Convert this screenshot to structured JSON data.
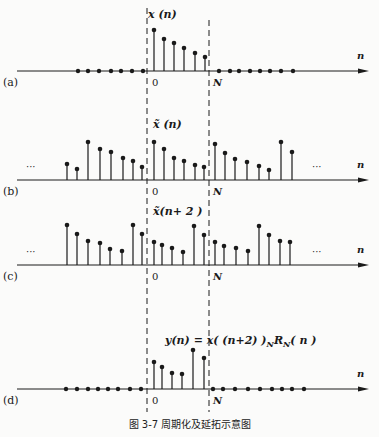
{
  "caption": "图 3-7   周期化及延拓示意图",
  "dashed_lines": {
    "zero_label": "0",
    "N_label": "N"
  },
  "axis_label": "n",
  "ellipsis": "···",
  "panels": [
    {
      "id": "a",
      "tag": "(a)",
      "title": "x (n)",
      "axis_y": 71,
      "dots_before": [
        78,
        88,
        99,
        111,
        121,
        132,
        143
      ],
      "stems": [
        {
          "x": 154,
          "h": 41
        },
        {
          "x": 164,
          "h": 32
        },
        {
          "x": 174,
          "h": 28
        },
        {
          "x": 184,
          "h": 23
        },
        {
          "x": 195,
          "h": 18
        },
        {
          "x": 205,
          "h": 14
        }
      ],
      "dots_after": [
        219,
        230,
        239,
        250,
        260,
        270,
        281,
        293
      ]
    },
    {
      "id": "b",
      "tag": "(b)",
      "title": "x̃ (n)",
      "axis_y": 180,
      "stems": [
        {
          "x": 67,
          "h": 16
        },
        {
          "x": 77,
          "h": 11
        },
        {
          "x": 88,
          "h": 38
        },
        {
          "x": 100,
          "h": 31
        },
        {
          "x": 111,
          "h": 28
        },
        {
          "x": 123,
          "h": 22
        },
        {
          "x": 133,
          "h": 19
        },
        {
          "x": 142,
          "h": 13
        },
        {
          "x": 154,
          "h": 38
        },
        {
          "x": 164,
          "h": 31
        },
        {
          "x": 174,
          "h": 22
        },
        {
          "x": 184,
          "h": 19
        },
        {
          "x": 195,
          "h": 15
        },
        {
          "x": 204,
          "h": 13
        },
        {
          "x": 215,
          "h": 36
        },
        {
          "x": 225,
          "h": 27
        },
        {
          "x": 235,
          "h": 21
        },
        {
          "x": 247,
          "h": 18
        },
        {
          "x": 259,
          "h": 14
        },
        {
          "x": 269,
          "h": 10
        },
        {
          "x": 281,
          "h": 38
        },
        {
          "x": 292,
          "h": 28
        }
      ]
    },
    {
      "id": "c",
      "tag": "(c)",
      "title": "x̃(n+ 2 )",
      "axis_y": 265,
      "stems": [
        {
          "x": 67,
          "h": 40
        },
        {
          "x": 77,
          "h": 31
        },
        {
          "x": 88,
          "h": 24
        },
        {
          "x": 100,
          "h": 22
        },
        {
          "x": 110,
          "h": 16
        },
        {
          "x": 122,
          "h": 14
        },
        {
          "x": 133,
          "h": 40
        },
        {
          "x": 142,
          "h": 31
        },
        {
          "x": 154,
          "h": 23
        },
        {
          "x": 162,
          "h": 20
        },
        {
          "x": 172,
          "h": 17
        },
        {
          "x": 183,
          "h": 13
        },
        {
          "x": 194,
          "h": 39
        },
        {
          "x": 204,
          "h": 30
        },
        {
          "x": 215,
          "h": 23
        },
        {
          "x": 224,
          "h": 19
        },
        {
          "x": 236,
          "h": 17
        },
        {
          "x": 248,
          "h": 14
        },
        {
          "x": 259,
          "h": 39
        },
        {
          "x": 269,
          "h": 30
        },
        {
          "x": 280,
          "h": 24
        },
        {
          "x": 290,
          "h": 23
        }
      ]
    },
    {
      "id": "d",
      "tag": "(d)",
      "title": "y(n)  =  x( (n+2) )",
      "title_sub": "N",
      "title_tail": "R",
      "title_sub2": "N",
      "title_end": "( n )",
      "axis_y": 389,
      "dots_before": [
        66,
        77,
        88,
        98,
        108,
        118,
        130,
        141
      ],
      "stems": [
        {
          "x": 154,
          "h": 27
        },
        {
          "x": 162,
          "h": 22
        },
        {
          "x": 172,
          "h": 16
        },
        {
          "x": 182,
          "h": 15
        },
        {
          "x": 193,
          "h": 39
        },
        {
          "x": 204,
          "h": 31
        }
      ],
      "dots_after": [
        213,
        223,
        235,
        248,
        260,
        272,
        282,
        292,
        304
      ]
    }
  ]
}
